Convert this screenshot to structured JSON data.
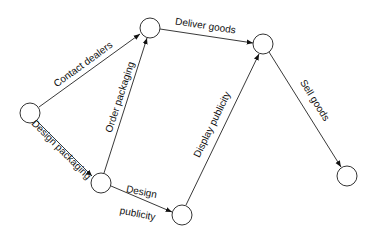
{
  "diagram": {
    "type": "activity-network",
    "nodes": [
      {
        "id": "n1",
        "cx": 30,
        "cy": 113,
        "r": 10
      },
      {
        "id": "n2",
        "cx": 150,
        "cy": 28,
        "r": 10
      },
      {
        "id": "n3",
        "cx": 263,
        "cy": 44,
        "r": 10
      },
      {
        "id": "n4",
        "cx": 101,
        "cy": 183,
        "r": 10
      },
      {
        "id": "n5",
        "cx": 182,
        "cy": 215,
        "r": 10
      },
      {
        "id": "n6",
        "cx": 347,
        "cy": 176,
        "r": 10
      }
    ],
    "edges": [
      {
        "from": "n1",
        "to": "n2",
        "label": "Contact dealers"
      },
      {
        "from": "n1",
        "to": "n4",
        "label": "Design packaging"
      },
      {
        "from": "n4",
        "to": "n2",
        "label": "Order packaging"
      },
      {
        "from": "n2",
        "to": "n3",
        "label": "Deliver goods"
      },
      {
        "from": "n4",
        "to": "n5",
        "label": "Design",
        "label2": "publicity"
      },
      {
        "from": "n5",
        "to": "n3",
        "label": "Display publicity"
      },
      {
        "from": "n3",
        "to": "n6",
        "label": "Sell goods"
      }
    ]
  },
  "labels": {
    "contact_dealers": "Contact dealers",
    "design_packaging": "Design packaging",
    "order_packaging": "Order packaging",
    "deliver_goods": "Deliver goods",
    "design_publicity_1": "Design",
    "design_publicity_2": "publicity",
    "display_publicity": "Display publicity",
    "sell_goods": "Sell goods"
  }
}
